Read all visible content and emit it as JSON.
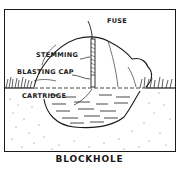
{
  "diagram": {
    "title": "BLOCKHOLE",
    "labels": {
      "fuse": "FUSE",
      "stemming": "STEMMING",
      "blasting_cap": "BLASTING CAP",
      "cartridge": "CARTRIDGE"
    },
    "colors": {
      "ink": "#1a1a1a",
      "background": "#ffffff"
    }
  }
}
